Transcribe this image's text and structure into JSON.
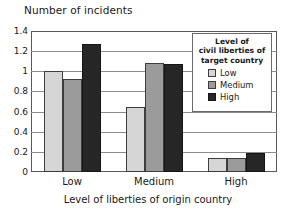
{
  "chart_data": {
    "type": "bar",
    "title": "Number of incidents",
    "xlabel": "Level of liberties of origin country",
    "ylabel": "Number of incidents",
    "categories": [
      "Low",
      "Medium",
      "High"
    ],
    "series": [
      {
        "name": "Low",
        "color": "#d6d6d6",
        "values": [
          1.0,
          0.65,
          0.14
        ]
      },
      {
        "name": "Medium",
        "color": "#9b9b9b",
        "values": [
          0.92,
          1.08,
          0.14
        ]
      },
      {
        "name": "High",
        "color": "#262626",
        "values": [
          1.27,
          1.07,
          0.19
        ]
      }
    ],
    "ylim": [
      0,
      1.4
    ],
    "ytick_labels": [
      "0",
      "0.2",
      "0.4",
      "0.6",
      "0.8",
      "1",
      "1.2",
      "1.4"
    ],
    "ytick_values": [
      0,
      0.2,
      0.4,
      0.6,
      0.8,
      1.0,
      1.2,
      1.4
    ],
    "grid": true,
    "legend_position": "top-right",
    "legend": {
      "title_lines": [
        "Level of",
        "civil liberties of",
        "target country"
      ],
      "entries": [
        {
          "label": "Low",
          "swatch": "low"
        },
        {
          "label": "Medium",
          "swatch": "medium"
        },
        {
          "label": "High",
          "swatch": "high"
        }
      ]
    }
  }
}
